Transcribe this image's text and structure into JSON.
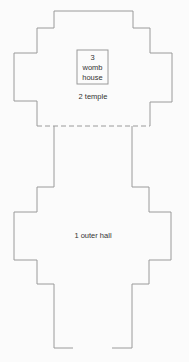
{
  "diagram": {
    "type": "floor-plan",
    "rooms": [
      {
        "id": "womb-house",
        "number": "3",
        "lines": [
          "3",
          "womb",
          "house"
        ]
      },
      {
        "id": "temple",
        "number": "2",
        "label": "2 temple"
      },
      {
        "id": "outer-hall",
        "number": "1",
        "label": "1 outer hall"
      }
    ],
    "boundary_between_temple_and_stem": "dashed",
    "colors": {
      "stroke": "#9a9a9a",
      "text": "#333333",
      "background": "#ffffff"
    }
  }
}
